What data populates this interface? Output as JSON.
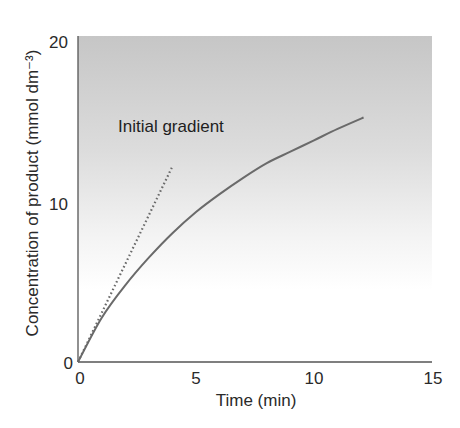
{
  "chart_data": {
    "type": "line",
    "title": "",
    "xlabel": "Time (min)",
    "ylabel": "Concentration of product (mmol dm⁻³)",
    "xlim": [
      0,
      15
    ],
    "ylim": [
      0,
      20
    ],
    "x_ticks": [
      0,
      5,
      10,
      15
    ],
    "y_ticks": [
      0,
      10,
      20
    ],
    "x_tick_labels": [
      "0",
      "5",
      "10",
      "15"
    ],
    "y_tick_labels": [
      "0",
      "10",
      "20"
    ],
    "grid": false,
    "legend": null,
    "background": "vertical gradient: grey (#c8c8c8) at top fading to white toward bottom third",
    "series": [
      {
        "name": "Product concentration",
        "style": "solid",
        "color": "#6a6a6a",
        "x": [
          0,
          1,
          2,
          3,
          4,
          5,
          6,
          7,
          8,
          9,
          10,
          11,
          12.1
        ],
        "y": [
          0,
          2.7,
          4.7,
          6.4,
          7.9,
          9.2,
          10.3,
          11.3,
          12.2,
          12.9,
          13.6,
          14.3,
          15.0
        ]
      },
      {
        "name": "Initial gradient",
        "style": "dotted",
        "color": "#6a6a6a",
        "x": [
          0,
          4
        ],
        "y": [
          0,
          12
        ]
      }
    ],
    "annotations": [
      {
        "text": "Initial gradient",
        "x": 1.7,
        "y": 14.5
      }
    ]
  },
  "labels": {
    "xlabel": "Time (min)",
    "ylabel": "Concentration of product (mmol dm⁻³)",
    "annotation": "Initial gradient",
    "x0": "0",
    "x5": "5",
    "x10": "10",
    "x15": "15",
    "y0": "0",
    "y10": "10",
    "y20": "20"
  }
}
